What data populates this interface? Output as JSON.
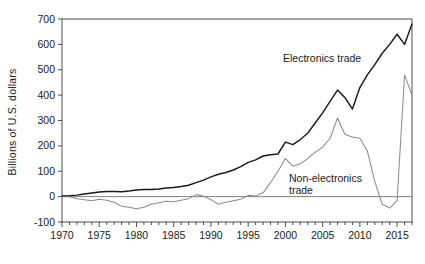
{
  "chart_data": {
    "type": "line",
    "title": "",
    "xlabel": "",
    "ylabel": "Billions of U.S. dollars",
    "xlim": [
      1970,
      2017
    ],
    "ylim": [
      -100,
      700
    ],
    "ytick_labels": [
      "700",
      "600",
      "500",
      "400",
      "300",
      "200",
      "100",
      "0",
      "-100"
    ],
    "ytick_values": [
      700,
      600,
      500,
      400,
      300,
      200,
      100,
      0,
      -100
    ],
    "xtick_labels": [
      "1970",
      "1975",
      "1980",
      "1985",
      "1990",
      "1995",
      "2000",
      "2005",
      "2010",
      "2015"
    ],
    "xtick_values": [
      1970,
      1975,
      1980,
      1985,
      1990,
      1995,
      2000,
      2005,
      2010,
      2015
    ],
    "minor_xticks_every": 1,
    "grid": false,
    "legend_position": "inline-annotations",
    "annotations": [
      {
        "text": "Electronics trade",
        "x": 2003,
        "y": 560
      },
      {
        "text": "Non-electronics",
        "x": 2002,
        "y": 120
      },
      {
        "text": "trade",
        "x": 2002,
        "y": 90
      }
    ],
    "x": [
      1970,
      1971,
      1972,
      1973,
      1974,
      1975,
      1976,
      1977,
      1978,
      1979,
      1980,
      1981,
      1982,
      1983,
      1984,
      1985,
      1986,
      1987,
      1988,
      1989,
      1990,
      1991,
      1992,
      1993,
      1994,
      1995,
      1996,
      1997,
      1998,
      1999,
      2000,
      2001,
      2002,
      2003,
      2004,
      2005,
      2006,
      2007,
      2008,
      2009,
      2010,
      2011,
      2012,
      2013,
      2014,
      2015,
      2016,
      2017
    ],
    "series": [
      {
        "name": "Electronics trade",
        "color": "#1a1a1a",
        "values": [
          3,
          4,
          6,
          10,
          14,
          18,
          20,
          20,
          19,
          22,
          26,
          28,
          28,
          30,
          34,
          36,
          40,
          45,
          55,
          65,
          78,
          88,
          95,
          105,
          118,
          135,
          145,
          160,
          165,
          168,
          215,
          205,
          225,
          250,
          290,
          330,
          375,
          420,
          390,
          345,
          430,
          480,
          520,
          565,
          600,
          640,
          600,
          680
        ]
      },
      {
        "name": "Non-electronics trade",
        "color": "#8c8c8c",
        "values": [
          2,
          0,
          -8,
          -12,
          -16,
          -10,
          -14,
          -22,
          -38,
          -42,
          -48,
          -42,
          -30,
          -24,
          -18,
          -20,
          -14,
          -8,
          8,
          2,
          -12,
          -30,
          -22,
          -16,
          -10,
          5,
          2,
          15,
          55,
          100,
          150,
          120,
          130,
          150,
          175,
          195,
          230,
          310,
          245,
          235,
          230,
          180,
          60,
          -30,
          -45,
          -15,
          480,
          400
        ]
      }
    ]
  }
}
